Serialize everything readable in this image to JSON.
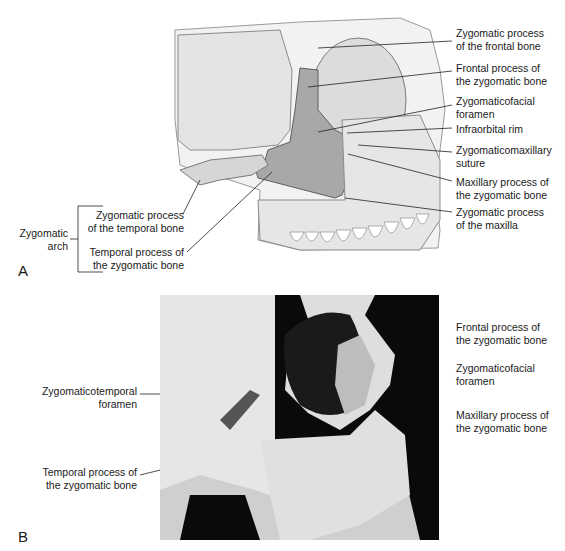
{
  "panel_a": {
    "letter": "A",
    "labels_right": [
      {
        "id": "zygomatic-process-frontal-bone",
        "text": "Zygomatic process\nof the frontal bone"
      },
      {
        "id": "frontal-process-zygomatic-bone",
        "text": "Frontal process of\nthe zygomatic bone"
      },
      {
        "id": "zygomaticofacial-foramen",
        "text": "Zygomaticofacial\nforamen"
      },
      {
        "id": "infraorbital-rim",
        "text": "Infraorbital rim"
      },
      {
        "id": "zygomaticomaxillary-suture",
        "text": "Zygomaticomaxillary\nsuture"
      },
      {
        "id": "maxillary-process-zygomatic-bone",
        "text": "Maxillary process of\nthe zygomatic bone"
      },
      {
        "id": "zygomatic-process-maxilla",
        "text": "Zygomatic process\nof the maxilla"
      }
    ],
    "labels_left": [
      {
        "id": "zygomatic-process-temporal-bone",
        "text": "Zygomatic process\nof the temporal bone"
      },
      {
        "id": "temporal-process-zygomatic-bone",
        "text": "Temporal process of\nthe zygomatic bone"
      }
    ],
    "bracket_label": "Zygomatic\narch"
  },
  "panel_b": {
    "letter": "B",
    "labels_right": [
      {
        "id": "frontal-process-zygomatic-bone",
        "text": "Frontal process of\nthe zygomatic bone"
      },
      {
        "id": "zygomaticofacial-foramen",
        "text": "Zygomaticofacial\nforamen"
      },
      {
        "id": "maxillary-process-zygomatic-bone",
        "text": "Maxillary process of\nthe zygomatic bone"
      }
    ],
    "labels_left": [
      {
        "id": "zygomaticotemporal-foramen",
        "text": "Zygomaticotemporal\nforamen"
      },
      {
        "id": "temporal-process-zygomatic-bone",
        "text": "Temporal process of\nthe zygomatic bone"
      }
    ]
  }
}
